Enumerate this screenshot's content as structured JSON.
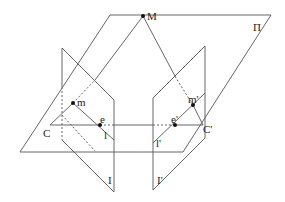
{
  "diagram": {
    "type": "epipolar-geometry",
    "line_color": "#555555",
    "point_color": "#111111",
    "labels": {
      "M": "M",
      "Pi": "Π",
      "m": "m",
      "m_prime": "m'",
      "e": "e",
      "e_prime": "e'",
      "C": "C",
      "C_prime": "C'",
      "l": "l",
      "l_prime": "l'",
      "I": "I",
      "I_prime": "I'"
    }
  }
}
